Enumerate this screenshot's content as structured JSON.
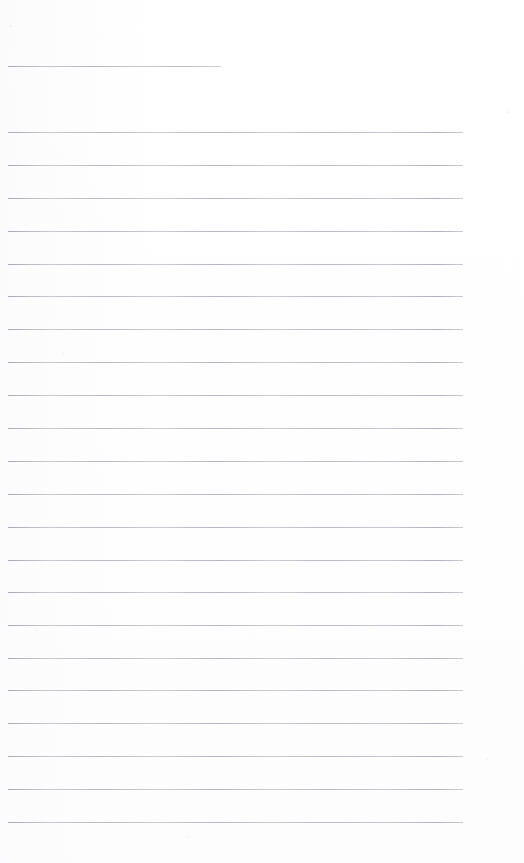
{
  "document": {
    "kind": "lined-paper-scan",
    "page_width": 524,
    "page_height": 863,
    "background_color": "#fefefe",
    "rule_color": "#c9c9ce",
    "text_content": "",
    "rule_left_x": 8,
    "rule_right_x": 463,
    "rule_spacing": 32.8,
    "rules": [
      {
        "name": "title-rule",
        "y": 66,
        "x1": 8,
        "x2": 221,
        "short": true
      },
      {
        "name": "body-rule-1",
        "y": 132,
        "x1": 8,
        "x2": 463,
        "short": false
      },
      {
        "name": "body-rule-2",
        "y": 165,
        "x1": 8,
        "x2": 463,
        "short": false
      },
      {
        "name": "body-rule-3",
        "y": 198,
        "x1": 8,
        "x2": 463,
        "short": false
      },
      {
        "name": "body-rule-4",
        "y": 231,
        "x1": 8,
        "x2": 463,
        "short": false
      },
      {
        "name": "body-rule-5",
        "y": 264,
        "x1": 8,
        "x2": 463,
        "short": false
      },
      {
        "name": "body-rule-6",
        "y": 296,
        "x1": 8,
        "x2": 463,
        "short": false
      },
      {
        "name": "body-rule-7",
        "y": 329,
        "x1": 8,
        "x2": 463,
        "short": false
      },
      {
        "name": "body-rule-8",
        "y": 362,
        "x1": 8,
        "x2": 463,
        "short": false
      },
      {
        "name": "body-rule-9",
        "y": 395,
        "x1": 8,
        "x2": 463,
        "short": false
      },
      {
        "name": "body-rule-10",
        "y": 428,
        "x1": 8,
        "x2": 463,
        "short": false
      },
      {
        "name": "body-rule-11",
        "y": 461,
        "x1": 8,
        "x2": 463,
        "short": false
      },
      {
        "name": "body-rule-12",
        "y": 494,
        "x1": 8,
        "x2": 463,
        "short": false
      },
      {
        "name": "body-rule-13",
        "y": 527,
        "x1": 8,
        "x2": 463,
        "short": false
      },
      {
        "name": "body-rule-14",
        "y": 560,
        "x1": 8,
        "x2": 463,
        "short": false
      },
      {
        "name": "body-rule-15",
        "y": 592,
        "x1": 8,
        "x2": 463,
        "short": false
      },
      {
        "name": "body-rule-16",
        "y": 625,
        "x1": 8,
        "x2": 463,
        "short": false
      },
      {
        "name": "body-rule-17",
        "y": 658,
        "x1": 8,
        "x2": 463,
        "short": false
      },
      {
        "name": "body-rule-18",
        "y": 690,
        "x1": 8,
        "x2": 463,
        "short": false
      },
      {
        "name": "body-rule-19",
        "y": 723,
        "x1": 8,
        "x2": 463,
        "short": false
      },
      {
        "name": "body-rule-20",
        "y": 756,
        "x1": 8,
        "x2": 463,
        "short": false
      },
      {
        "name": "body-rule-21",
        "y": 789,
        "x1": 8,
        "x2": 463,
        "short": false
      },
      {
        "name": "body-rule-22",
        "y": 822,
        "x1": 8,
        "x2": 463,
        "short": false
      }
    ]
  }
}
